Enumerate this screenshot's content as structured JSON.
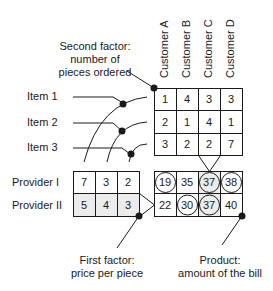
{
  "annotations": {
    "second_factor": [
      "Second factor:",
      "number of",
      "pieces ordered"
    ],
    "first_factor": [
      "First factor:",
      "price per piece"
    ],
    "product": [
      "Product:",
      "amount of the bill"
    ]
  },
  "columns": [
    "Customer A",
    "Customer B",
    "Customer C",
    "Customer D"
  ],
  "items": [
    "Item 1",
    "Item 2",
    "Item 3"
  ],
  "providers": [
    "Provider I",
    "Provider II"
  ],
  "quantities": [
    [
      "1",
      "4",
      "3",
      "3"
    ],
    [
      "2",
      "1",
      "4",
      "1"
    ],
    [
      "3",
      "2",
      "2",
      "7"
    ]
  ],
  "prices": [
    [
      "7",
      "3",
      "2"
    ],
    [
      "5",
      "4",
      "3"
    ]
  ],
  "bills": [
    [
      "19",
      "35",
      "37",
      "38"
    ],
    [
      "22",
      "30",
      "37",
      "40"
    ]
  ],
  "circled_cells": [
    [
      0,
      0
    ],
    [
      0,
      2
    ],
    [
      0,
      3
    ],
    [
      1,
      1
    ],
    [
      1,
      2
    ]
  ],
  "colors": {
    "line": "#1a1a1a",
    "shaded_cell": "#ececec",
    "background": "#ffffff"
  }
}
